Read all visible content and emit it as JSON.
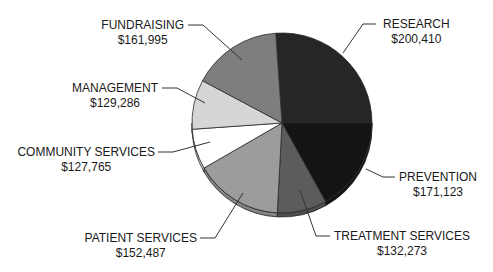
{
  "chart_data": {
    "type": "pie",
    "title": "",
    "style": "3d-tilted",
    "legend": "none (leader-line labels)",
    "center": [
      282,
      123
    ],
    "radius": 90,
    "depth": 4,
    "slices": [
      {
        "label": "RESEARCH",
        "value": 200410,
        "display": "$200,410",
        "color": "#262626",
        "start": -4,
        "end": 90,
        "leader": [
          [
            343,
            53
          ],
          [
            363,
            24
          ],
          [
            376,
            24
          ]
        ],
        "label_pos": [
          383,
          17
        ],
        "align": "left"
      },
      {
        "label": "PREVENTION",
        "value": 171123,
        "display": "$171,123",
        "color": "#141414",
        "start": 90,
        "end": 151,
        "leader": [
          [
            366,
            169
          ],
          [
            383,
            177
          ],
          [
            395,
            177
          ]
        ],
        "label_pos": [
          399,
          170
        ],
        "align": "left"
      },
      {
        "label": "TREATMENT SERVICES",
        "value": 132273,
        "display": "$132,273",
        "color": "#5c5c5c",
        "start": 151,
        "end": 183,
        "leader": [
          [
            300,
            190
          ],
          [
            316,
            236
          ],
          [
            330,
            236
          ]
        ],
        "label_pos": [
          334,
          229
        ],
        "align": "left"
      },
      {
        "label": "PATIENT SERVICES",
        "value": 152487,
        "display": "$152,487",
        "color": "#9c9c9c",
        "start": 183,
        "end": 240,
        "leader": [
          [
            243,
            193
          ],
          [
            215,
            238
          ],
          [
            200,
            238
          ]
        ],
        "label_pos": [
          197,
          231
        ],
        "align": "right"
      },
      {
        "label": "COMMUNITY SERVICES",
        "value": 127765,
        "display": "$127,765",
        "color": "#ffffff",
        "start": 240,
        "end": 266,
        "leader": [
          [
            210,
            142
          ],
          [
            173,
            152
          ],
          [
            158,
            152
          ]
        ],
        "label_pos": [
          155,
          145
        ],
        "align": "right"
      },
      {
        "label": "MANAGEMENT",
        "value": 129286,
        "display": "$129,286",
        "color": "#d6d6d6",
        "start": 266,
        "end": 298,
        "leader": [
          [
            205,
            103
          ],
          [
            177,
            88
          ],
          [
            162,
            88
          ]
        ],
        "label_pos": [
          158,
          81
        ],
        "align": "right"
      },
      {
        "label": "FUNDRAISING",
        "value": 161995,
        "display": "$161,995",
        "color": "#7e7e7e",
        "start": 298,
        "end": 356,
        "leader": [
          [
            242,
            60
          ],
          [
            203,
            25
          ],
          [
            188,
            25
          ]
        ],
        "label_pos": [
          184,
          18
        ],
        "align": "right"
      }
    ],
    "total": 1075339
  }
}
